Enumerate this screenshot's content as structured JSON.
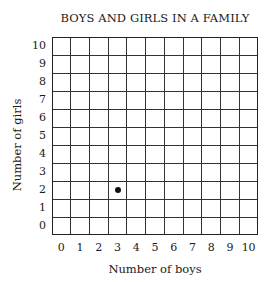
{
  "chart_data": {
    "type": "scatter",
    "title": "BOYS AND GIRLS IN A FAMILY",
    "xlabel": "Number of boys",
    "ylabel": "Number of girls",
    "x_ticks": [
      "0",
      "1",
      "2",
      "3",
      "4",
      "5",
      "6",
      "7",
      "8",
      "9",
      "10"
    ],
    "y_ticks": [
      "0",
      "1",
      "2",
      "3",
      "4",
      "5",
      "6",
      "7",
      "8",
      "9",
      "10"
    ],
    "xlim": [
      0,
      10
    ],
    "ylim": [
      0,
      10
    ],
    "grid": true,
    "legend": null,
    "points": [
      {
        "x": 3,
        "y": 2
      }
    ]
  }
}
